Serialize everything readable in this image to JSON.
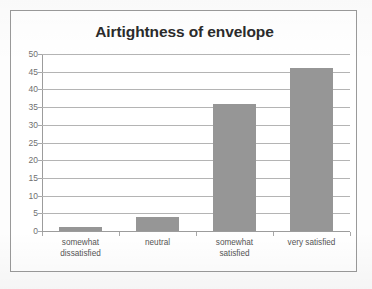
{
  "chart_data": {
    "type": "bar",
    "title": "Airtightness of envelope",
    "categories": [
      "somewhat dissatisfied",
      "neutral",
      "somewhat satisfied",
      "very satisfied"
    ],
    "category_lines": [
      [
        "somewhat",
        "dissatisfied"
      ],
      [
        "neutral"
      ],
      [
        "somewhat",
        "satisfied"
      ],
      [
        "very satisfied"
      ]
    ],
    "values": [
      1,
      4,
      36,
      46
    ],
    "xlabel": "",
    "ylabel": "",
    "ylim": [
      0,
      50
    ],
    "ytick_step": 5,
    "yticks": [
      50,
      45,
      40,
      35,
      30,
      25,
      20,
      15,
      10,
      5,
      0
    ],
    "ytick_labels": [
      "50",
      "45",
      "40",
      "35",
      "30",
      "25",
      "20",
      "15",
      "10",
      "5",
      "0"
    ],
    "grid": true,
    "legend": false,
    "legend_position": "none",
    "colors": {
      "bar": "#969696",
      "gridline": "#b4b4b4",
      "axis": "#9c9c9c",
      "title_text": "#2b2b2b",
      "tick_text": "#6f6f6f",
      "category_text": "#555555",
      "frame_border": "#9a9a9a",
      "background": "#ffffff"
    }
  }
}
